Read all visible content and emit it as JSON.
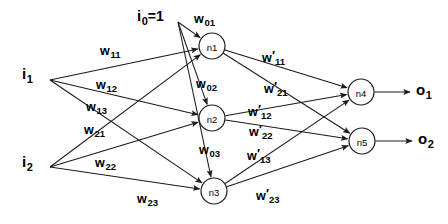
{
  "diagram": {
    "stroke_color": "#1a1a1a",
    "background_color": "#ffffff",
    "inputs": [
      {
        "id": "i0",
        "base": "i",
        "sub": "0",
        "suffix": "=1",
        "x": 137,
        "y": 8,
        "fan_x": 178,
        "fan_y": 22
      },
      {
        "id": "i1",
        "base": "i",
        "sub": "1",
        "suffix": "",
        "x": 22,
        "y": 66,
        "fan_x": 50,
        "fan_y": 80
      },
      {
        "id": "i2",
        "base": "i",
        "sub": "2",
        "suffix": "",
        "x": 22,
        "y": 154,
        "fan_x": 50,
        "fan_y": 167
      }
    ],
    "hidden_nodes": [
      {
        "id": "n1",
        "label": "n1",
        "cx": 212,
        "cy": 46,
        "r": 13
      },
      {
        "id": "n2",
        "label": "n2",
        "cx": 212,
        "cy": 118,
        "r": 13
      },
      {
        "id": "n3",
        "label": "n3",
        "cx": 214,
        "cy": 191,
        "r": 13
      }
    ],
    "output_nodes": [
      {
        "id": "n4",
        "label": "n4",
        "cx": 361,
        "cy": 92,
        "r": 13
      },
      {
        "id": "n5",
        "label": "n5",
        "cx": 362,
        "cy": 141,
        "r": 13
      }
    ],
    "outputs": [
      {
        "id": "o1",
        "base": "o",
        "sub": "1",
        "x": 416,
        "y": 82,
        "arrow_from_x": 375,
        "arrow_to_x": 410,
        "y_line": 92
      },
      {
        "id": "o2",
        "base": "o",
        "sub": "2",
        "x": 418,
        "y": 131,
        "arrow_from_x": 376,
        "arrow_to_x": 412,
        "y_line": 141
      }
    ],
    "input_weight_labels": [
      {
        "id": "w01",
        "base": "w",
        "prime": false,
        "sub": "01",
        "x": 194,
        "y": 11
      },
      {
        "id": "w02",
        "base": "w",
        "prime": false,
        "sub": "02",
        "x": 196,
        "y": 76
      },
      {
        "id": "w03",
        "base": "w",
        "prime": false,
        "sub": "03",
        "x": 199,
        "y": 142
      },
      {
        "id": "w11",
        "base": "w",
        "prime": false,
        "sub": "11",
        "x": 100,
        "y": 43
      },
      {
        "id": "w12",
        "base": "w",
        "prime": false,
        "sub": "12",
        "x": 96,
        "y": 77
      },
      {
        "id": "w13",
        "base": "w",
        "prime": false,
        "sub": "13",
        "x": 86,
        "y": 99
      },
      {
        "id": "w21",
        "base": "w",
        "prime": false,
        "sub": "21",
        "x": 84,
        "y": 122
      },
      {
        "id": "w22",
        "base": "w",
        "prime": false,
        "sub": "22",
        "x": 95,
        "y": 155
      },
      {
        "id": "w23",
        "base": "w",
        "prime": false,
        "sub": "23",
        "x": 137,
        "y": 191
      }
    ],
    "hidden_weight_labels": [
      {
        "id": "wp11",
        "base": "w",
        "prime": true,
        "sub": "11",
        "x": 262,
        "y": 50
      },
      {
        "id": "wp21",
        "base": "w",
        "prime": true,
        "sub": "21",
        "x": 264,
        "y": 81
      },
      {
        "id": "wp12",
        "base": "w",
        "prime": true,
        "sub": "12",
        "x": 248,
        "y": 104
      },
      {
        "id": "wp22",
        "base": "w",
        "prime": true,
        "sub": "22",
        "x": 249,
        "y": 124
      },
      {
        "id": "wp13",
        "base": "w",
        "prime": true,
        "sub": "13",
        "x": 247,
        "y": 148
      },
      {
        "id": "wp23",
        "base": "w",
        "prime": true,
        "sub": "23",
        "x": 256,
        "y": 188
      }
    ],
    "edges": [
      {
        "id": "e-i0-n1",
        "from": "i0",
        "to": "n1",
        "weight": "w01"
      },
      {
        "id": "e-i0-n2",
        "from": "i0",
        "to": "n2",
        "weight": "w02"
      },
      {
        "id": "e-i0-n3",
        "from": "i0",
        "to": "n3",
        "weight": "w03"
      },
      {
        "id": "e-i1-n1",
        "from": "i1",
        "to": "n1",
        "weight": "w11"
      },
      {
        "id": "e-i1-n2",
        "from": "i1",
        "to": "n2",
        "weight": "w12"
      },
      {
        "id": "e-i1-n3",
        "from": "i1",
        "to": "n3",
        "weight": "w13"
      },
      {
        "id": "e-i2-n1",
        "from": "i2",
        "to": "n1",
        "weight": "w21"
      },
      {
        "id": "e-i2-n2",
        "from": "i2",
        "to": "n2",
        "weight": "w22"
      },
      {
        "id": "e-i2-n3",
        "from": "i2",
        "to": "n3",
        "weight": "w23"
      },
      {
        "id": "e-n1-n4",
        "from": "n1",
        "to": "n4",
        "weight": "wp11"
      },
      {
        "id": "e-n1-n5",
        "from": "n1",
        "to": "n5",
        "weight": "wp12"
      },
      {
        "id": "e-n2-n4",
        "from": "n2",
        "to": "n4",
        "weight": "wp21"
      },
      {
        "id": "e-n2-n5",
        "from": "n2",
        "to": "n5",
        "weight": "wp22"
      },
      {
        "id": "e-n3-n4",
        "from": "n3",
        "to": "n4",
        "weight": "wp13"
      },
      {
        "id": "e-n3-n5",
        "from": "n3",
        "to": "n5",
        "weight": "wp23"
      },
      {
        "id": "e-n4-o1",
        "from": "n4",
        "to": "o1",
        "weight": ""
      },
      {
        "id": "e-n5-o2",
        "from": "n5",
        "to": "o2",
        "weight": ""
      }
    ]
  }
}
